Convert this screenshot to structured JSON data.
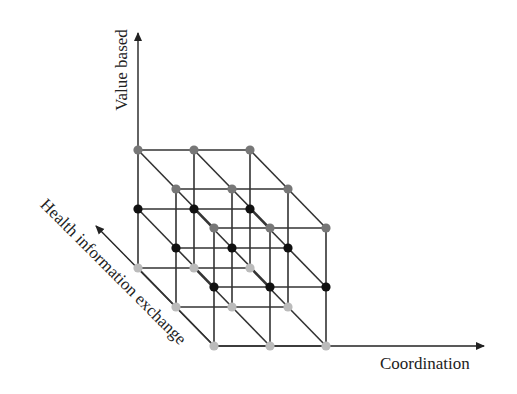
{
  "diagram": {
    "axes": {
      "vertical": "Value based",
      "horizontal": "Coordination",
      "diagonal": "Health information exchange"
    },
    "grid": {
      "dimensions": [
        3,
        3,
        3
      ],
      "origin_back_top_left": [
        138,
        150
      ],
      "x_step": [
        56,
        0
      ],
      "depth_step": [
        38,
        39
      ],
      "level_step": [
        0,
        59
      ]
    },
    "levels": [
      {
        "name": "top",
        "node_color": "#777777"
      },
      {
        "name": "middle",
        "node_color": "#111111"
      },
      {
        "name": "bottom",
        "node_color": "#bbbbbb"
      }
    ],
    "colors": {
      "line": "#333333",
      "axis": "#222222"
    }
  }
}
